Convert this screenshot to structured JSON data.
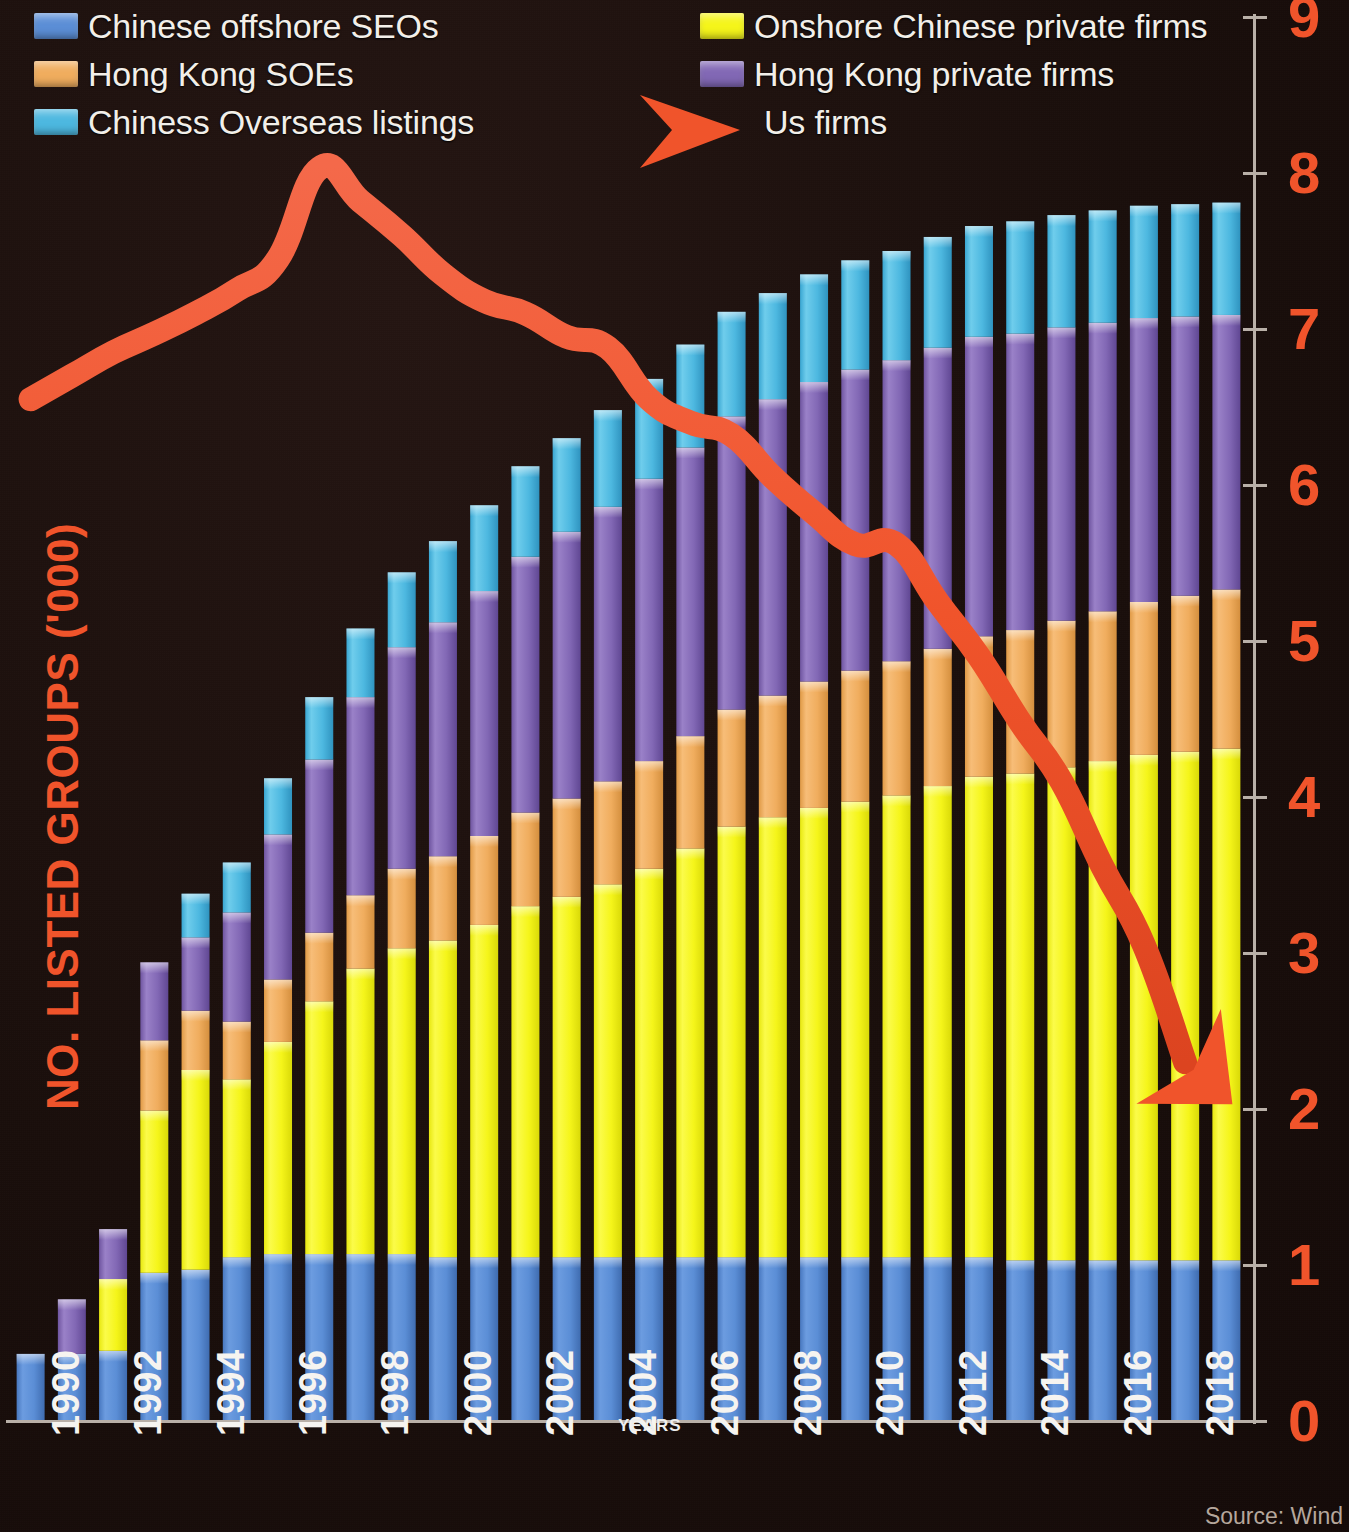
{
  "legend": {
    "left": [
      {
        "label": "Chinese offshore SEOs",
        "color": "#5b8ed6",
        "key": "offshore_soe"
      },
      {
        "label": "Hong Kong SOEs",
        "color": "#f0ad5e",
        "key": "hk_soe"
      },
      {
        "label": "Chiness Overseas listings",
        "color": "#4db8e0",
        "key": "overseas"
      }
    ],
    "right": [
      {
        "label": "Onshore Chinese private firms",
        "color": "#f5f51a",
        "key": "onshore_priv"
      },
      {
        "label": "Hong Kong private firms",
        "color": "#8268b5",
        "key": "hk_priv"
      },
      {
        "label": "Us firms",
        "color": "#f0542b",
        "key": "us_firms",
        "marker": "arrow"
      }
    ]
  },
  "axis": {
    "y_title": "NO. LISTED GROUPS ('000)",
    "x_title": "YEARS",
    "y_ticks": [
      0,
      1,
      2,
      3,
      4,
      5,
      6,
      7,
      8,
      9
    ],
    "y_min": 0,
    "y_max": 9,
    "x_tick_labels": [
      "1990",
      "1992",
      "1994",
      "1996",
      "1998",
      "2000",
      "2002",
      "2004",
      "2006",
      "2008",
      "2010",
      "2012",
      "2014",
      "2016",
      "2018"
    ],
    "tick_color": "#f0542b",
    "axis_color": "#b9b0a8"
  },
  "source": "Source: Wind",
  "colors": {
    "background": "#1a0f0c",
    "blue": "#5b8ed6",
    "yellow": "#f5f51a",
    "orange": "#f0ad5e",
    "purple": "#8268b5",
    "cyan": "#4db8e0",
    "line": "#f0542b",
    "legend_text": "#f2efe9"
  },
  "chart_data": {
    "type": "bar",
    "subtype": "stacked-bar-with-line-overlay",
    "title": "",
    "xlabel": "YEARS",
    "ylabel": "NO. LISTED GROUPS ('000)",
    "ylim": [
      0,
      9
    ],
    "grid": false,
    "legend_position": "top",
    "categories": [
      "1990",
      "1991",
      "1992",
      "1993",
      "1994",
      "1995",
      "1996",
      "1997",
      "1998",
      "1999",
      "2000",
      "2001",
      "2002",
      "2003",
      "2004",
      "2005",
      "2006",
      "2007",
      "2008",
      "2009",
      "2010",
      "2011",
      "2012",
      "2013",
      "2014",
      "2015",
      "2016",
      "2017",
      "2018",
      "2019"
    ],
    "series": [
      {
        "name": "Chinese offshore SEOs",
        "color": "#5b8ed6",
        "values": [
          0.43,
          0.43,
          0.45,
          0.95,
          0.97,
          1.05,
          1.07,
          1.07,
          1.07,
          1.07,
          1.05,
          1.05,
          1.05,
          1.05,
          1.05,
          1.05,
          1.05,
          1.05,
          1.05,
          1.05,
          1.05,
          1.05,
          1.05,
          1.05,
          1.03,
          1.03,
          1.03,
          1.03,
          1.03,
          1.03
        ]
      },
      {
        "name": "Onshore Chinese private firms",
        "color": "#f5f51a",
        "values": [
          0,
          0,
          0.46,
          1.04,
          1.28,
          1.14,
          1.36,
          1.62,
          1.83,
          1.96,
          2.03,
          2.13,
          2.25,
          2.31,
          2.39,
          2.49,
          2.62,
          2.76,
          2.82,
          2.88,
          2.92,
          2.96,
          3.02,
          3.08,
          3.12,
          3.16,
          3.2,
          3.24,
          3.26,
          3.28
        ]
      },
      {
        "name": "Hong Kong SOEs",
        "color": "#f0ad5e",
        "values": [
          0,
          0,
          0,
          0.45,
          0.38,
          0.37,
          0.4,
          0.44,
          0.47,
          0.51,
          0.54,
          0.57,
          0.6,
          0.63,
          0.66,
          0.69,
          0.72,
          0.75,
          0.78,
          0.81,
          0.84,
          0.86,
          0.88,
          0.9,
          0.92,
          0.94,
          0.96,
          0.98,
          1.0,
          1.02
        ]
      },
      {
        "name": "Hong Kong private firms",
        "color": "#8268b5",
        "values": [
          0,
          0.35,
          0.32,
          0.5,
          0.47,
          0.7,
          0.93,
          1.11,
          1.27,
          1.42,
          1.5,
          1.57,
          1.64,
          1.71,
          1.76,
          1.81,
          1.85,
          1.88,
          1.9,
          1.92,
          1.93,
          1.93,
          1.93,
          1.92,
          1.9,
          1.88,
          1.85,
          1.82,
          1.79,
          1.76
        ]
      },
      {
        "name": "Chiness Overseas listings",
        "color": "#4db8e0",
        "values": [
          0,
          0,
          0,
          0,
          0.28,
          0.32,
          0.36,
          0.4,
          0.44,
          0.48,
          0.52,
          0.55,
          0.58,
          0.6,
          0.62,
          0.64,
          0.66,
          0.67,
          0.68,
          0.69,
          0.7,
          0.7,
          0.71,
          0.71,
          0.72,
          0.72,
          0.72,
          0.72,
          0.72,
          0.72
        ]
      }
    ],
    "overlay_line": {
      "name": "Us firms",
      "color": "#f0542b",
      "arrow_end": true,
      "x": [
        "1990",
        "1991",
        "1992",
        "1993",
        "1994",
        "1995",
        "1996",
        "1997",
        "1998",
        "1999",
        "2000",
        "2001",
        "2002",
        "2003",
        "2004",
        "2005",
        "2006",
        "2007",
        "2008",
        "2009",
        "2010",
        "2011",
        "2012",
        "2013",
        "2014",
        "2015",
        "2016",
        "2017",
        "2018",
        "2019"
      ],
      "values": [
        6.55,
        6.7,
        6.85,
        6.97,
        7.1,
        7.25,
        7.45,
        8.03,
        7.82,
        7.6,
        7.35,
        7.18,
        7.1,
        6.95,
        6.88,
        6.55,
        6.4,
        6.32,
        6.05,
        5.82,
        5.62,
        5.62,
        5.25,
        4.9,
        4.48,
        4.1,
        3.55,
        3.05,
        2.3,
        2.03
      ]
    }
  }
}
